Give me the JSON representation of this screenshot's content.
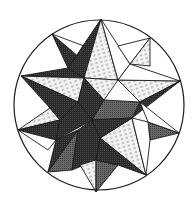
{
  "figure": {
    "shades": {
      "dark": "#2e2e2e",
      "medium": "#5a5a5a",
      "light": "#e6e6e6",
      "white": "#ffffff",
      "line": "#1a1a1a"
    }
  }
}
